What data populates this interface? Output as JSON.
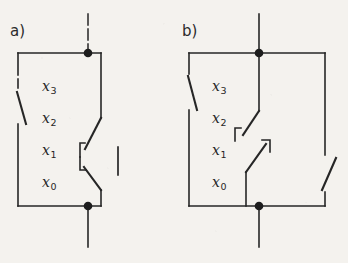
{
  "figure": {
    "background_color": "#f4f2ee",
    "ink_color": "#262626",
    "title": "",
    "panels": [
      {
        "id": "a",
        "label": "a)",
        "variables": [
          {
            "name": "x",
            "subscript": "3"
          },
          {
            "name": "x",
            "subscript": "2"
          },
          {
            "name": "x",
            "subscript": "1"
          },
          {
            "name": "x",
            "subscript": "0"
          }
        ],
        "nodes": [
          {
            "name": "top-terminal-node",
            "x": 88,
            "y": 53
          },
          {
            "name": "bottom-terminal-node",
            "x": 88,
            "y": 206
          }
        ],
        "leads": [
          {
            "name": "top-lead",
            "from_y": 14,
            "to_y": 53,
            "x": 88
          },
          {
            "name": "bottom-lead",
            "from_y": 206,
            "to_y": 247,
            "x": 88
          }
        ],
        "branches": [
          {
            "name": "left-branch",
            "switch_count": 1,
            "orientation": "down-right"
          },
          {
            "name": "right-branch",
            "switch_count": 2,
            "orientation": "ganged-pair"
          }
        ],
        "ganged_link": {
          "name": "mechanical-link-bar",
          "present": true
        }
      },
      {
        "id": "b",
        "label": "b)",
        "variables": [
          {
            "name": "x",
            "subscript": "3"
          },
          {
            "name": "x",
            "subscript": "2"
          },
          {
            "name": "x",
            "subscript": "1"
          },
          {
            "name": "x",
            "subscript": "0"
          }
        ],
        "nodes": [
          {
            "name": "top-terminal-node",
            "x": 259,
            "y": 53
          },
          {
            "name": "bottom-terminal-node",
            "x": 259,
            "y": 206
          }
        ],
        "leads": [
          {
            "name": "top-lead",
            "from_y": 14,
            "to_y": 53,
            "x": 259
          },
          {
            "name": "bottom-lead",
            "from_y": 206,
            "to_y": 247,
            "x": 259
          }
        ],
        "branches": [
          {
            "name": "left-branch",
            "switch_count": 1,
            "orientation": "down-right"
          },
          {
            "name": "middle-branch",
            "switch_count": 2,
            "orientation": "series-pair"
          },
          {
            "name": "right-branch",
            "switch_count": 1,
            "orientation": "down-left"
          }
        ],
        "ganged_link": {
          "name": "mechanical-link-bar",
          "present": false
        }
      }
    ]
  }
}
